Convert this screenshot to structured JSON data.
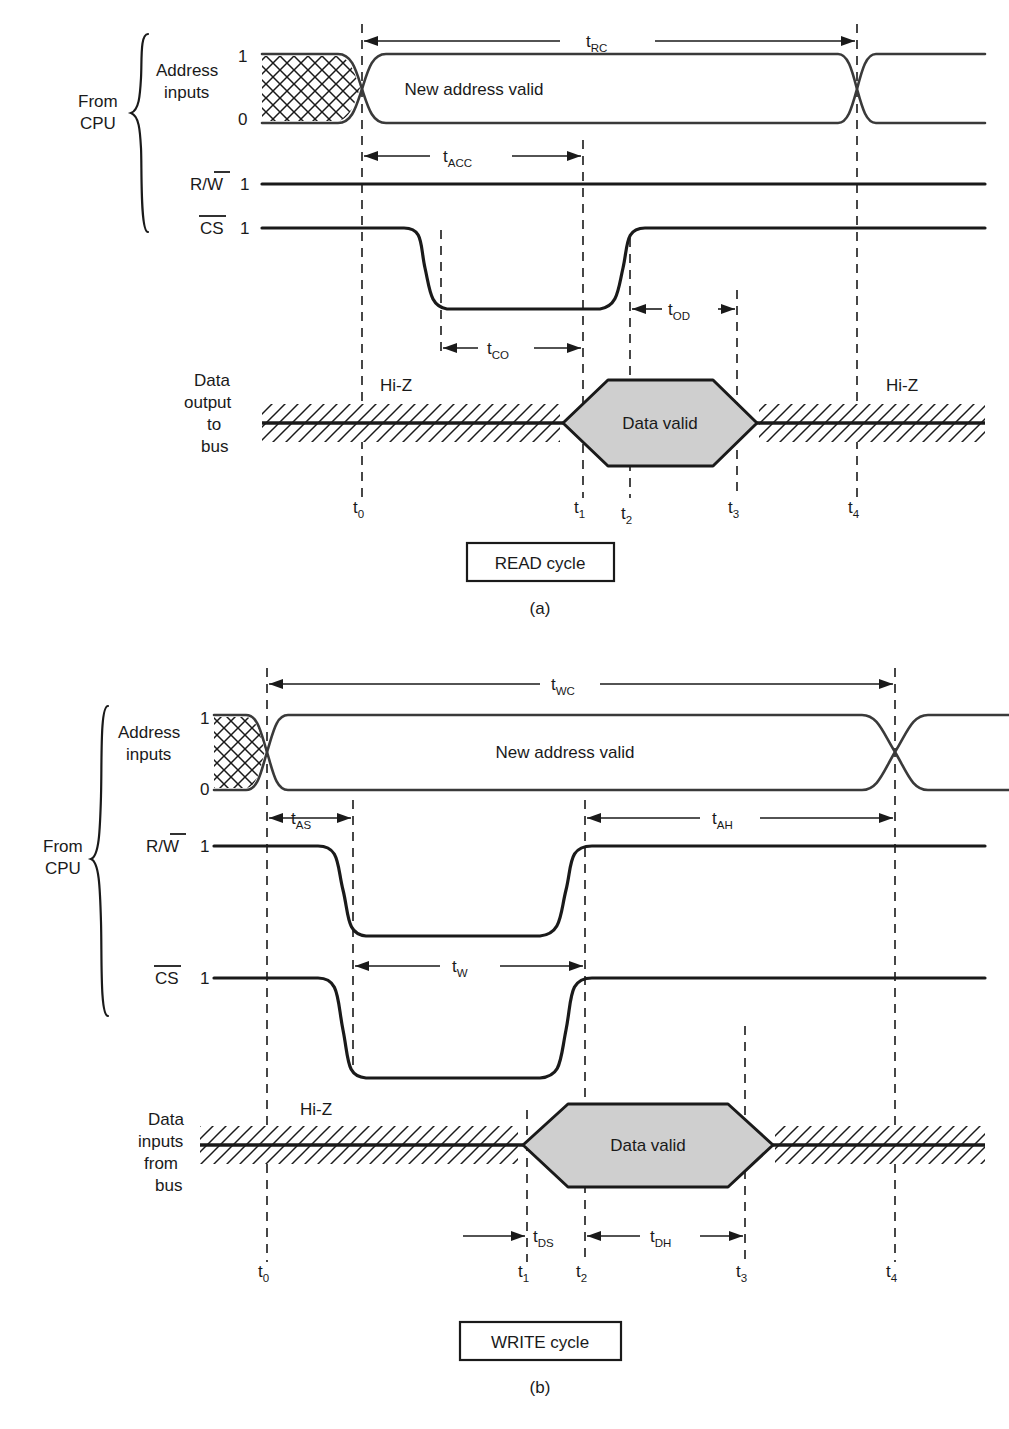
{
  "figure": {
    "type": "timing-diagram"
  },
  "read_cycle": {
    "caption": "READ cycle",
    "subcaption": "(a)",
    "group_label_line1": "From",
    "group_label_line2": "CPU",
    "rows": [
      {
        "name": "address-inputs",
        "label_line1": "Address",
        "label_line2": "inputs",
        "level_high": "1",
        "level_low": "0",
        "bus_text": "New address valid"
      },
      {
        "name": "read-write",
        "label": "R/W",
        "label_overline": "W",
        "level_high": "1"
      },
      {
        "name": "chip-select",
        "label": "CS",
        "label_overline": "CS",
        "level_high": "1"
      },
      {
        "name": "data-output",
        "label_line1": "Data",
        "label_line2": "output",
        "label_line3": "to",
        "label_line4": "bus",
        "hiz_left": "Hi-Z",
        "hiz_right": "Hi-Z",
        "valid_text": "Data valid"
      }
    ],
    "intervals": [
      {
        "name": "t-rc",
        "base": "t",
        "sub": "RC"
      },
      {
        "name": "t-acc",
        "base": "t",
        "sub": "ACC"
      },
      {
        "name": "t-co",
        "base": "t",
        "sub": "CO"
      },
      {
        "name": "t-od",
        "base": "t",
        "sub": "OD"
      }
    ],
    "time_markers": [
      {
        "base": "t",
        "sub": "0"
      },
      {
        "base": "t",
        "sub": "1"
      },
      {
        "base": "t",
        "sub": "2"
      },
      {
        "base": "t",
        "sub": "3"
      },
      {
        "base": "t",
        "sub": "4"
      }
    ]
  },
  "write_cycle": {
    "caption": "WRITE cycle",
    "subcaption": "(b)",
    "group_label_line1": "From",
    "group_label_line2": "CPU",
    "rows": [
      {
        "name": "address-inputs",
        "label_line1": "Address",
        "label_line2": "inputs",
        "level_high": "1",
        "level_low": "0",
        "bus_text": "New address valid"
      },
      {
        "name": "read-write",
        "label": "R/W",
        "label_overline": "W",
        "level_high": "1"
      },
      {
        "name": "chip-select",
        "label": "CS",
        "label_overline": "CS",
        "level_high": "1"
      },
      {
        "name": "data-inputs",
        "label_line1": "Data",
        "label_line2": "inputs",
        "label_line3": "from",
        "label_line4": "bus",
        "hiz_left": "Hi-Z",
        "valid_text": "Data valid"
      }
    ],
    "intervals": [
      {
        "name": "t-wc",
        "base": "t",
        "sub": "WC"
      },
      {
        "name": "t-as",
        "base": "t",
        "sub": "AS"
      },
      {
        "name": "t-ah",
        "base": "t",
        "sub": "AH"
      },
      {
        "name": "t-w",
        "base": "t",
        "sub": "W"
      },
      {
        "name": "t-ds",
        "base": "t",
        "sub": "DS"
      },
      {
        "name": "t-dh",
        "base": "t",
        "sub": "DH"
      }
    ],
    "time_markers": [
      {
        "base": "t",
        "sub": "0"
      },
      {
        "base": "t",
        "sub": "1"
      },
      {
        "base": "t",
        "sub": "2"
      },
      {
        "base": "t",
        "sub": "3"
      },
      {
        "base": "t",
        "sub": "4"
      }
    ]
  },
  "colors": {
    "ink": "#1a1a1a",
    "valid_fill": "#cfcfcf",
    "background": "#ffffff"
  }
}
